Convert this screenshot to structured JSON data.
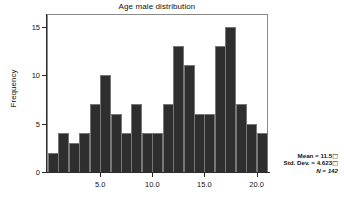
{
  "chart_data": {
    "type": "bar",
    "title": "Age male distribution",
    "xlabel": "",
    "ylabel": "Frequency",
    "grid": false,
    "legend": null,
    "xlim": [
      0,
      21.0
    ],
    "ylim": [
      0,
      16.2
    ],
    "x_ticks": [
      "5.0",
      "10.0",
      "15.0",
      "20.0"
    ],
    "x_tick_values": [
      5.0,
      10.0,
      15.0,
      20.0
    ],
    "y_ticks": [
      "0",
      "5",
      "10",
      "15"
    ],
    "y_tick_values": [
      0,
      5,
      10,
      15
    ],
    "bin_width": 0.833,
    "bin_centers": [
      2.08,
      2.92,
      3.75,
      4.58,
      5.42,
      6.25,
      7.08,
      7.92,
      8.75,
      9.58,
      10.42,
      11.25,
      12.08,
      12.92,
      13.75,
      14.58,
      15.42,
      16.25,
      17.08,
      17.92,
      18.75
    ],
    "bin_starts": [
      1.67,
      2.5,
      3.33,
      4.17,
      5.0,
      5.83,
      6.67,
      7.5,
      8.33,
      9.17,
      10.0,
      10.83,
      11.67,
      12.5,
      13.33,
      14.17,
      15.0,
      15.83,
      16.67,
      17.5,
      18.33
    ],
    "values": [
      2,
      4,
      3,
      4,
      7,
      10,
      6,
      4,
      7,
      4,
      4,
      7,
      13,
      11,
      6,
      6,
      13,
      15,
      7,
      5,
      4
    ],
    "bar_color": "#2e2e2e",
    "bar_edge_color": "#777777"
  },
  "annotations": {
    "mean_label": "Mean = 11.5",
    "std_dev_label": "Std. Dev. = 4.623",
    "n_label": "N = 142",
    "mean_value": 11.5,
    "std_dev_value": 4.623,
    "n_value": 142
  },
  "colors": {
    "background": "#ffffff",
    "axis": "#2b2b2b",
    "frame": "#8a8a8a",
    "text": "#111111"
  }
}
